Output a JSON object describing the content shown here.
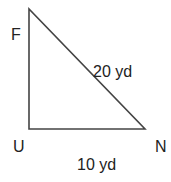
{
  "diagram": {
    "type": "right-triangle",
    "stroke_color": "#444444",
    "vertices": [
      {
        "label": "F",
        "x": 29,
        "y": 9
      },
      {
        "label": "U",
        "x": 29,
        "y": 129
      },
      {
        "label": "N",
        "x": 145,
        "y": 129
      }
    ],
    "vertex_labels": {
      "F": "F",
      "U": "U",
      "N": "N"
    },
    "sides": {
      "hypotenuse": {
        "from": "F",
        "to": "N",
        "label": "20 yd"
      },
      "base": {
        "from": "U",
        "to": "N",
        "label": "10 yd"
      },
      "height": {
        "from": "F",
        "to": "U",
        "label": ""
      }
    }
  }
}
